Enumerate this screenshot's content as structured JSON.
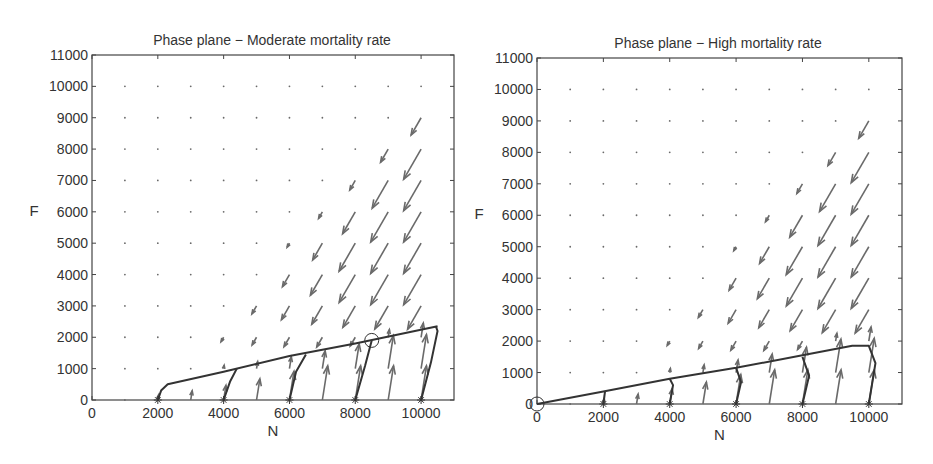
{
  "chart_data": [
    {
      "type": "quiver",
      "title": "Phase plane - Moderate mortality rate",
      "xlabel": "N",
      "ylabel": "F",
      "xlim": [
        0,
        11000
      ],
      "ylim": [
        0,
        11000
      ],
      "xticks": [
        "0",
        "2000",
        "4000",
        "6000",
        "8000",
        "10000"
      ],
      "yticks": [
        "0",
        "1000",
        "2000",
        "3000",
        "4000",
        "5000",
        "6000",
        "7000",
        "8000",
        "9000",
        "10000",
        "11000"
      ],
      "grid": false,
      "vector_field_grid": {
        "x": [
          1000,
          2000,
          3000,
          4000,
          5000,
          6000,
          7000,
          8000,
          9000,
          10000
        ],
        "y": [
          0,
          1000,
          2000,
          3000,
          4000,
          5000,
          6000,
          7000,
          8000,
          9000,
          10000
        ]
      },
      "equilibrium": {
        "N": 8500,
        "F": 1900,
        "marker": "circle"
      },
      "trajectories": [
        {
          "start": [
            2000,
            0
          ],
          "points": [
            [
              2000,
              0
            ],
            [
              2100,
              300
            ],
            [
              2300,
              500
            ],
            [
              4000,
              900
            ],
            [
              6000,
              1400
            ],
            [
              8000,
              1800
            ],
            [
              10500,
              2350
            ]
          ]
        },
        {
          "start": [
            4000,
            0
          ],
          "points": [
            [
              4000,
              0
            ],
            [
              4200,
              600
            ],
            [
              4400,
              1000
            ]
          ]
        },
        {
          "start": [
            6000,
            0
          ],
          "points": [
            [
              6000,
              0
            ],
            [
              6200,
              900
            ],
            [
              6500,
              1450
            ]
          ]
        },
        {
          "start": [
            8000,
            0
          ],
          "points": [
            [
              8000,
              0
            ],
            [
              8300,
              1100
            ],
            [
              8500,
              1900
            ]
          ]
        },
        {
          "start": [
            10000,
            0
          ],
          "points": [
            [
              10000,
              0
            ],
            [
              10300,
              1200
            ],
            [
              10500,
              2200
            ],
            [
              10450,
              2350
            ]
          ]
        }
      ],
      "start_marker": "asterisk"
    },
    {
      "type": "quiver",
      "title": "Phase plane - High mortality rate",
      "xlabel": "N",
      "ylabel": "F",
      "xlim": [
        0,
        11000
      ],
      "ylim": [
        0,
        11000
      ],
      "xticks": [
        "0",
        "2000",
        "4000",
        "6000",
        "8000",
        "10000"
      ],
      "yticks": [
        "0",
        "1000",
        "2000",
        "3000",
        "4000",
        "5000",
        "6000",
        "7000",
        "8000",
        "9000",
        "10000",
        "11000"
      ],
      "grid": false,
      "vector_field_grid": {
        "x": [
          1000,
          2000,
          3000,
          4000,
          5000,
          6000,
          7000,
          8000,
          9000,
          10000
        ],
        "y": [
          0,
          1000,
          2000,
          3000,
          4000,
          5000,
          6000,
          7000,
          8000,
          9000,
          10000
        ]
      },
      "equilibrium": {
        "N": 0,
        "F": 0,
        "marker": "circle"
      },
      "trajectories": [
        {
          "start": [
            2000,
            0
          ],
          "points": [
            [
              2000,
              0
            ],
            [
              2050,
              400
            ]
          ]
        },
        {
          "start": [
            4000,
            0
          ],
          "points": [
            [
              4000,
              0
            ],
            [
              4100,
              600
            ],
            [
              4000,
              800
            ]
          ]
        },
        {
          "start": [
            6000,
            0
          ],
          "points": [
            [
              6000,
              0
            ],
            [
              6150,
              700
            ],
            [
              6000,
              1150
            ]
          ]
        },
        {
          "start": [
            8000,
            0
          ],
          "points": [
            [
              8000,
              0
            ],
            [
              8200,
              900
            ],
            [
              8000,
              1500
            ]
          ]
        },
        {
          "start": [
            10000,
            0
          ],
          "points": [
            [
              10000,
              0
            ],
            [
              10200,
              1300
            ],
            [
              10000,
              1850
            ],
            [
              9500,
              1850
            ],
            [
              8000,
              1550
            ],
            [
              6000,
              1150
            ],
            [
              4000,
              800
            ],
            [
              2000,
              400
            ],
            [
              0,
              0
            ]
          ]
        }
      ],
      "start_marker": "asterisk"
    }
  ],
  "plots": [
    {
      "title": "Phase plane − Moderate mortality rate",
      "xlabel": "N",
      "ylabel": "F"
    },
    {
      "title": "Phase plane − High mortality rate",
      "xlabel": "N",
      "ylabel": "F"
    }
  ],
  "colors": {
    "axis": "#444444",
    "arrow": "#6a6a6a",
    "trajectory": "#333333"
  }
}
